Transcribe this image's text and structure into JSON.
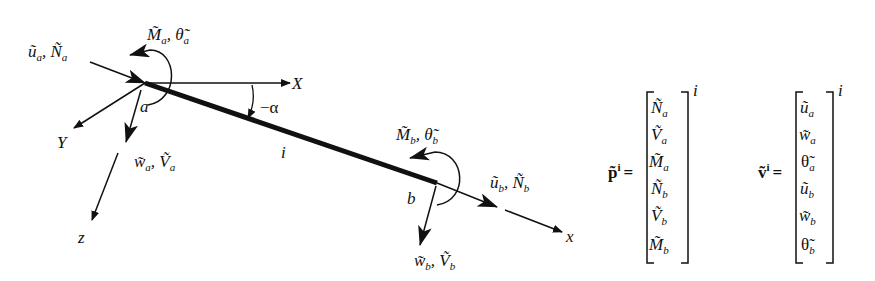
{
  "diagram": {
    "colors": {
      "ink": "#111111",
      "background": "#ffffff"
    },
    "global_axes": {
      "x_label": "X",
      "y_label": "Y"
    },
    "local_axes": {
      "x_label": "x",
      "z_label": "z"
    },
    "element": {
      "label": "i",
      "node_a": "a",
      "node_b": "b",
      "angle_label": "−α"
    },
    "node_a_labels": {
      "axial": {
        "u": "ũ",
        "u_sub": "a",
        "sep": ", ",
        "N": "Ñ",
        "N_sub": "a"
      },
      "shear": {
        "w": "w̃",
        "w_sub": "a",
        "sep": ", ",
        "V": "Ṽ",
        "V_sub": "a"
      },
      "moment": {
        "M": "M̃",
        "M_sub": "a",
        "sep": ", ",
        "theta": "θ̃",
        "theta_sub": "a"
      }
    },
    "node_b_labels": {
      "axial": {
        "u": "ũ",
        "u_sub": "b",
        "sep": ", ",
        "N": "Ñ",
        "N_sub": "b"
      },
      "shear": {
        "w": "w̃",
        "w_sub": "b",
        "sep": ", ",
        "V": "Ṽ",
        "V_sub": "b"
      },
      "moment": {
        "M": "M̃",
        "M_sub": "b",
        "sep": ", ",
        "theta": "θ̃",
        "theta_sub": "b"
      }
    }
  },
  "equations": {
    "force_vector": {
      "lhs": "p̃",
      "lhs_sup": "i",
      "equals": "=",
      "superscript": "i",
      "entries": [
        {
          "sym": "Ñ",
          "sub": "a"
        },
        {
          "sym": "Ṽ",
          "sub": "a"
        },
        {
          "sym": "M̃",
          "sub": "a"
        },
        {
          "sym": "Ñ",
          "sub": "b"
        },
        {
          "sym": "Ṽ",
          "sub": "b"
        },
        {
          "sym": "M̃",
          "sub": "b"
        }
      ]
    },
    "displacement_vector": {
      "lhs": "ṽ",
      "lhs_sup": "i",
      "equals": "=",
      "superscript": "i",
      "entries": [
        {
          "sym": "ũ",
          "sub": "a"
        },
        {
          "sym": "w̃",
          "sub": "a"
        },
        {
          "sym": "θ̃",
          "sub": "a"
        },
        {
          "sym": "ũ",
          "sub": "b"
        },
        {
          "sym": "w̃",
          "sub": "b"
        },
        {
          "sym": "θ̃",
          "sub": "b"
        }
      ]
    }
  }
}
